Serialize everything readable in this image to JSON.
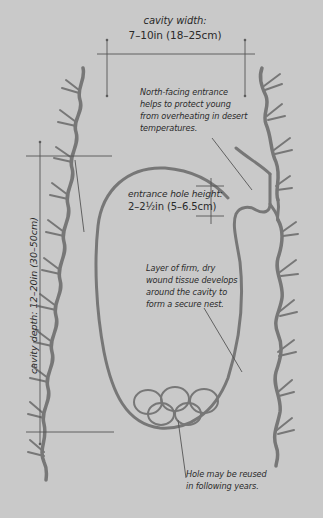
{
  "diagram": {
    "background_color": "#c9c9c9",
    "tree_color": "#777777",
    "line_color": "#444444",
    "labels": {
      "cavity_width": {
        "title": "cavity width:",
        "value": "7–10in (18–25cm)"
      },
      "north_facing": {
        "line1": "North-facing entrance",
        "line2": "helps to protect young",
        "line3": "from overheating in desert",
        "line4": "temperatures."
      },
      "entrance_height": {
        "title": "entrance hole height:",
        "value": "2–2½in (5–6.5cm)"
      },
      "wound_tissue": {
        "line1": "Layer of firm, dry",
        "line2": "wound tissue develops",
        "line3": "around the cavity to",
        "line4": "form a secure nest."
      },
      "cavity_depth": "cavity depth: 12–20in (30–50cm)",
      "reuse": {
        "line1": "Hole may be reused",
        "line2": "in following years."
      }
    },
    "eggs": {
      "count": 5,
      "rows": [
        3,
        2
      ]
    }
  }
}
